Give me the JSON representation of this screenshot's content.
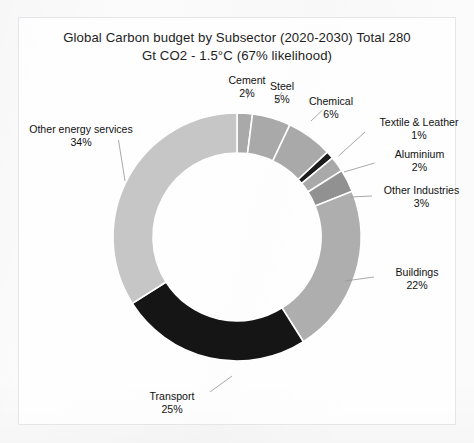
{
  "chart_data": {
    "type": "pie",
    "variant": "donut",
    "title": "Global Carbon budget by Subsector (2020-2030) Total 280\nGt CO2 - 1.5°C (67% likelihood)",
    "title_line1": "Global Carbon budget by Subsector (2020-2030) Total 280",
    "title_line2": "Gt CO2 - 1.5°C (67% likelihood)",
    "total_label": "Total 280 Gt CO2",
    "unit": "%",
    "start_angle_deg": 0,
    "direction": "clockwise",
    "legend": "none",
    "grid": false,
    "labels": [
      "Cement",
      "Steel",
      "Chemical",
      "Textile & Leather",
      "Aluminium",
      "Other Industries",
      "Buildings",
      "Transport",
      "Other energy services"
    ],
    "values": [
      2,
      5,
      6,
      1,
      2,
      3,
      22,
      25,
      34
    ],
    "value_texts": [
      "2%",
      "5%",
      "6%",
      "1%",
      "2%",
      "3%",
      "22%",
      "25%",
      "34%"
    ],
    "colors": [
      "#a9a9a9",
      "#a9a9a9",
      "#a9a9a9",
      "#1c1c1c",
      "#a9a9a9",
      "#919191",
      "#aeaeae",
      "#151515",
      "#c6c6c6"
    ],
    "slice_border_color": "#ffffff",
    "slices": [
      {
        "label": "Cement",
        "value": 2,
        "value_text": "2%",
        "color": "#a9a9a9"
      },
      {
        "label": "Steel",
        "value": 5,
        "value_text": "5%",
        "color": "#a9a9a9"
      },
      {
        "label": "Chemical",
        "value": 6,
        "value_text": "6%",
        "color": "#a9a9a9"
      },
      {
        "label": "Textile & Leather",
        "value": 1,
        "value_text": "1%",
        "color": "#1c1c1c"
      },
      {
        "label": "Aluminium",
        "value": 2,
        "value_text": "2%",
        "color": "#a9a9a9"
      },
      {
        "label": "Other Industries",
        "value": 3,
        "value_text": "3%",
        "color": "#919191"
      },
      {
        "label": "Buildings",
        "value": 22,
        "value_text": "22%",
        "color": "#aeaeae"
      },
      {
        "label": "Transport",
        "value": 25,
        "value_text": "25%",
        "color": "#151515"
      },
      {
        "label": "Other energy services",
        "value": 34,
        "value_text": "34%",
        "color": "#c6c6c6"
      }
    ]
  }
}
